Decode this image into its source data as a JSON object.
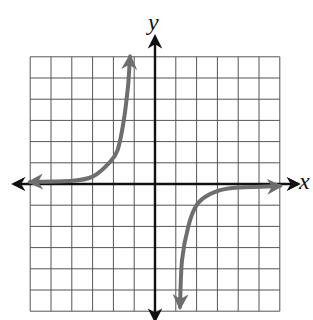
{
  "chart_data": {
    "type": "line",
    "title": "",
    "xlabel": "x",
    "ylabel": "y",
    "xlim": [
      -6,
      6
    ],
    "ylim": [
      -6,
      6
    ],
    "grid": true,
    "grid_step": 1,
    "legend": null,
    "asymptotes": {
      "vertical": 0,
      "horizontal": 0
    },
    "series": [
      {
        "name": "branch-upper-left",
        "x": [
          -6,
          -4,
          -3,
          -2.2,
          -1.8,
          -1.5,
          -1.3,
          -1.2
        ],
        "y": [
          0.1,
          0.15,
          0.35,
          1.0,
          1.6,
          3.0,
          4.6,
          6.0
        ]
      },
      {
        "name": "branch-lower-right",
        "x": [
          1.2,
          1.3,
          1.6,
          2.0,
          2.6,
          3.6,
          6.0
        ],
        "y": [
          -5.8,
          -3.6,
          -2.0,
          -1.0,
          -0.5,
          -0.2,
          -0.1
        ]
      }
    ],
    "colors": {
      "curve": "#6e6e6e",
      "axes": "#111111",
      "grid": "#555555"
    }
  },
  "labels": {
    "x_axis": "x",
    "y_axis": "y"
  }
}
